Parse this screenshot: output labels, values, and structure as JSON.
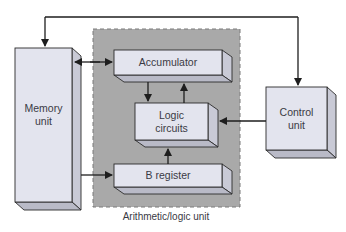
{
  "diagram": {
    "type": "block-diagram",
    "colors": {
      "background": "#ffffff",
      "alu_region": "#a9a9a9",
      "box_front": "#e3e4ee",
      "box_side": "#c9cad6",
      "box_bottom": "#b9bac7",
      "stroke": "#2a2a2a",
      "text": "#3a3a44"
    },
    "nodes": {
      "memory": {
        "line1": "Memory",
        "line2": "unit"
      },
      "accumulator": {
        "label": "Accumulator"
      },
      "logic": {
        "line1": "Logic",
        "line2": "circuits"
      },
      "bregister": {
        "label": "B register"
      },
      "control": {
        "line1": "Control",
        "line2": "unit"
      },
      "alu": {
        "label": "Arithmetic/logic unit"
      }
    },
    "edges": [
      {
        "from": "control unit",
        "to": "memory unit",
        "style": "arrow",
        "route": "over top"
      },
      {
        "from": "memory unit",
        "to": "control unit",
        "style": "arrow",
        "route": "over top"
      },
      {
        "from": "memory unit",
        "to": "accumulator",
        "style": "bidirectional arrow"
      },
      {
        "from": "accumulator",
        "to": "logic circuits",
        "style": "arrow"
      },
      {
        "from": "logic circuits",
        "to": "accumulator",
        "style": "arrow"
      },
      {
        "from": "b register",
        "to": "logic circuits",
        "style": "arrow"
      },
      {
        "from": "memory unit",
        "to": "b register",
        "style": "arrow"
      },
      {
        "from": "control unit",
        "to": "logic circuits",
        "style": "arrow"
      }
    ]
  }
}
